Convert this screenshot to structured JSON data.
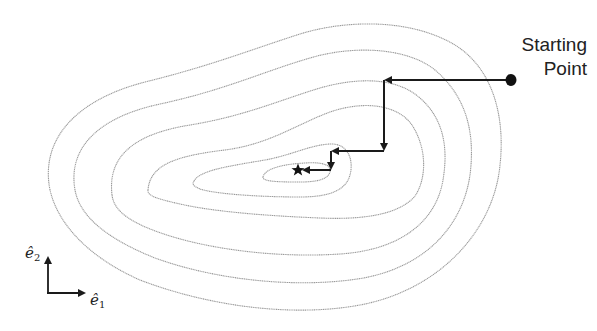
{
  "diagram": {
    "start_label_line1": "Starting",
    "start_label_line2": "Point",
    "axis": {
      "e1_symbol": "ê",
      "e1_subscript": "1",
      "e2_symbol": "ê",
      "e2_subscript": "2"
    },
    "contour_count": 6,
    "minimum_marker": "star",
    "start_marker": "filled-circle",
    "path_points": [
      {
        "x": 511,
        "y": 80
      },
      {
        "x": 384,
        "y": 80
      },
      {
        "x": 384,
        "y": 151
      },
      {
        "x": 331,
        "y": 151
      },
      {
        "x": 331,
        "y": 170
      },
      {
        "x": 300,
        "y": 170
      }
    ],
    "colors": {
      "contour": "#9a9a9a",
      "path": "#1a1a1a",
      "background": "#ffffff"
    }
  }
}
